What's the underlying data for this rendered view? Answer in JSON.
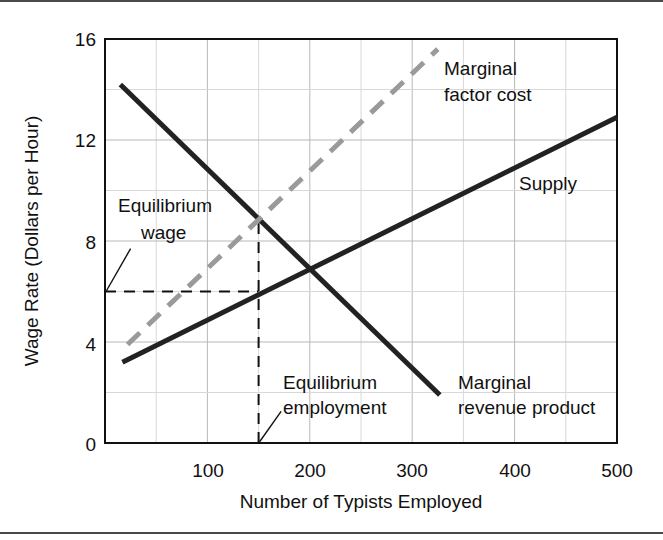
{
  "figure": {
    "has_top_rule": true,
    "has_bottom_rule": true,
    "background": "#ffffff"
  },
  "chart_data": {
    "type": "line",
    "title": "",
    "xlabel": "Number of Typists Employed",
    "ylabel": "Wage Rate (Dollars per Hour)",
    "xlim": [
      0,
      500
    ],
    "ylim": [
      0,
      16
    ],
    "xticks": [
      100,
      200,
      300,
      400,
      500
    ],
    "yticks": [
      0,
      4,
      8,
      12,
      16
    ],
    "xtick_labels": [
      "100",
      "200",
      "300",
      "400",
      "500"
    ],
    "ytick_labels": [
      "0",
      "4",
      "8",
      "12",
      "16"
    ],
    "grid": true,
    "grid_minor_x_step": 50,
    "grid_minor_y_step": 2,
    "legend": "none",
    "series": [
      {
        "name": "Marginal revenue product",
        "style": "solid",
        "color": "#222222",
        "width": 5,
        "points": [
          [
            15,
            14.2
          ],
          [
            327,
            1.9
          ]
        ]
      },
      {
        "name": "Supply",
        "style": "solid",
        "color": "#222222",
        "width": 5,
        "points": [
          [
            17,
            3.2
          ],
          [
            500,
            12.9
          ]
        ]
      },
      {
        "name": "Marginal factor cost",
        "style": "dashed",
        "color": "#9a9a9a",
        "width": 5,
        "points": [
          [
            22,
            3.9
          ],
          [
            325,
            15.6
          ]
        ]
      }
    ],
    "reference_lines": [
      {
        "name": "equilibrium-wage-line",
        "orientation": "horizontal",
        "value": 6,
        "from_x": 0,
        "to_x": 150,
        "style": "dashed",
        "color": "#111111"
      },
      {
        "name": "equilibrium-employment-line",
        "orientation": "vertical",
        "value": 150,
        "from_y": 0,
        "to_y": 8.7,
        "style": "dashed",
        "color": "#111111"
      }
    ],
    "annotations": [
      {
        "name": "marginal-factor-cost-label",
        "lines": [
          "Marginal",
          "factor cost"
        ],
        "x": 330,
        "y": 14.6
      },
      {
        "name": "supply-label",
        "lines": [
          "Supply"
        ],
        "x": 405,
        "y": 10.2
      },
      {
        "name": "equilibrium-wage-label",
        "lines": [
          "Equilibrium",
          "wage"
        ],
        "x": 18,
        "y": 9.6,
        "leader": {
          "from": [
            25,
            7.7
          ],
          "to": [
            1,
            6.0
          ]
        }
      },
      {
        "name": "equilibrium-employment-label",
        "lines": [
          "Equilibrium",
          "employment"
        ],
        "x": 175,
        "y": 2.5,
        "leader": {
          "from": [
            172,
            1.25
          ],
          "to": [
            151,
            0.05
          ]
        }
      },
      {
        "name": "marginal-revenue-product-label",
        "lines": [
          "Marginal",
          "revenue product"
        ],
        "x": 345,
        "y": 2.5
      }
    ]
  },
  "colors": {
    "axis": "#111111",
    "grid_major": "#b8b8b8",
    "grid_minor": "#d8d8d8",
    "curve_dark": "#222222",
    "curve_gray": "#9a9a9a",
    "frame_rule": "#4a4a4a"
  }
}
